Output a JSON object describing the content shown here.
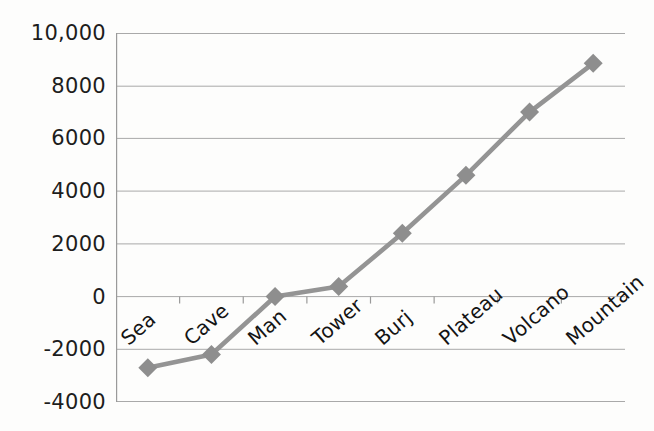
{
  "chart_data": {
    "type": "line",
    "title": "",
    "subtitle": "",
    "xlabel": "",
    "ylabel": "",
    "categories": [
      "Sea",
      "Cave",
      "Man",
      "Tower",
      "Burj",
      "Plateau",
      "Volcano",
      "Mountain"
    ],
    "values": [
      -2700,
      -2200,
      0,
      380,
      2400,
      4600,
      7000,
      8850
    ],
    "series": [
      {
        "name": "",
        "values": [
          -2700,
          -2200,
          0,
          380,
          2400,
          4600,
          7000,
          8850
        ]
      }
    ],
    "ylim": [
      -4000,
      10000
    ],
    "ytick_values": [
      10000,
      8000,
      6000,
      4000,
      2000,
      0,
      -2000,
      -4000
    ],
    "ytick_labels": [
      "10,000",
      "8000",
      "6000",
      "4000",
      "2000",
      "0",
      "-2000",
      "-4000"
    ],
    "ytick_step": 2000,
    "grid": "horizontal",
    "legend": "none",
    "marker": "diamond",
    "line_color": "#949494",
    "marker_color": "#8e8e8e",
    "grid_color": "#a8a8a8",
    "axis_color": "#9a9a9a",
    "xlabel_rotation": -41,
    "annotations": []
  }
}
